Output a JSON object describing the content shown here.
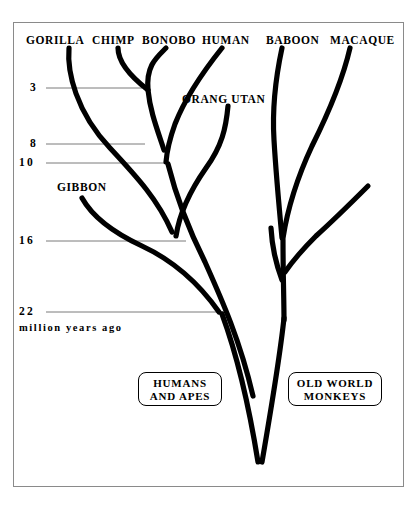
{
  "figure": {
    "background_color": "#ffffff",
    "frame_color": "#8a8a8a",
    "branch_color": "#000000",
    "tick_color": "#7a7a7a"
  },
  "axis": {
    "caption_lines": "million\nyears\nago",
    "caption_line_1": "million",
    "caption_line_2": "years",
    "caption_line_3": "ago",
    "ticks": [
      {
        "label": "3",
        "value": 3,
        "y": 88,
        "line_end_x": 142
      },
      {
        "label": "8",
        "value": 8,
        "y": 144,
        "line_end_x": 145
      },
      {
        "label": "10",
        "value": 10,
        "y": 163,
        "line_end_x": 166
      },
      {
        "label": "16",
        "value": 16,
        "y": 241,
        "line_end_x": 186
      },
      {
        "label": "22",
        "value": 22,
        "y": 312,
        "line_end_x": 226
      }
    ]
  },
  "taxa": [
    {
      "name": "GORILLA",
      "label": "GORILLA",
      "x": 26,
      "y": 35
    },
    {
      "name": "CHIMP",
      "label": "CHIMP",
      "x": 92,
      "y": 35
    },
    {
      "name": "BONOBO",
      "label": "BONOBO",
      "x": 142,
      "y": 35
    },
    {
      "name": "HUMAN",
      "label": "HUMAN",
      "x": 202,
      "y": 35
    },
    {
      "name": "BABOON",
      "label": "BABOON",
      "x": 266,
      "y": 35
    },
    {
      "name": "MACAQUE",
      "label": "MACAQUE",
      "x": 330,
      "y": 35
    },
    {
      "name": "ORANG UTAN",
      "label": "ORANG UTAN",
      "x": 182,
      "y": 94
    },
    {
      "name": "GIBBON",
      "label": "GIBBON",
      "x": 57,
      "y": 182
    }
  ],
  "clade_boxes": [
    {
      "name": "humans-and-apes",
      "text": "HUMANS\nAND  APES",
      "x": 138,
      "y": 372,
      "width": 84,
      "height": 34
    },
    {
      "name": "old-world-monkeys",
      "text": "OLD  WORLD\nMONKEYS",
      "x": 288,
      "y": 372,
      "width": 94,
      "height": 34
    }
  ],
  "branches": [
    {
      "name": "gorilla-branch",
      "d": "M 69,48 C 67,72 76,112 110,148 C 138,178 158,200 172,232"
    },
    {
      "name": "chimp-branch",
      "d": "M 118,48 C 118,62 130,76 148,90"
    },
    {
      "name": "bonobo-branch",
      "d": "M 166,48 C 156,58 146,66 148,90 C 150,110 156,126 164,150"
    },
    {
      "name": "human-branch",
      "d": "M 222,48 C 206,68 186,96 175,124 C 170,138 167,150 166,162"
    },
    {
      "name": "orang-utan-branch",
      "d": "M 228,106 C 226,128 222,146 206,168 C 192,188 180,210 176,236"
    },
    {
      "name": "ape-stem",
      "d": "M 168,164 C 176,196 188,228 205,262 C 222,300 240,340 253,396"
    },
    {
      "name": "gibbon-branch",
      "d": "M 82,198 C 92,216 112,232 142,246 C 172,260 198,282 219,312"
    },
    {
      "name": "ape-trunk-lower",
      "d": "M 222,314 C 236,352 248,400 258,462"
    },
    {
      "name": "baboon-branch",
      "d": "M 282,48 C 276,76 272,108 274,140 C 276,174 279,206 282,238"
    },
    {
      "name": "macaque-branch",
      "d": "M 350,48 C 344,74 330,110 312,146 C 298,176 288,206 283,238"
    },
    {
      "name": "monkey-side-branch-a",
      "d": "M 368,186 C 354,200 336,218 316,236 C 302,250 292,262 285,272"
    },
    {
      "name": "monkey-side-branch-b",
      "d": "M 271,228 C 272,246 276,264 282,280"
    },
    {
      "name": "monkey-stem",
      "d": "M 283,240 C 283,274 284,300 284,320"
    },
    {
      "name": "monkey-trunk-lower",
      "d": "M 284,318 C 280,356 272,404 262,462"
    }
  ]
}
